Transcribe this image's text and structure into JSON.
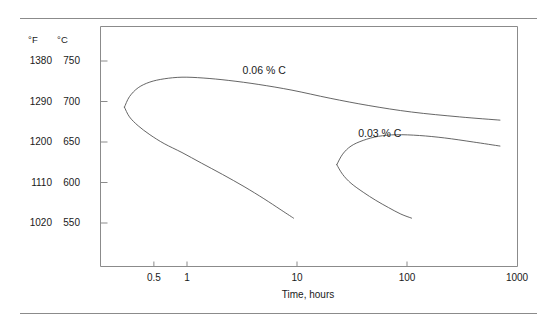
{
  "figure": {
    "background": "#ffffff",
    "line_color": "#555555",
    "frame_color": "#8b8b8b",
    "rule_color": "#8b8b8b"
  },
  "axis_headers": {
    "fahrenheit": "°F",
    "celsius": "°C"
  },
  "chart_data": {
    "type": "line",
    "title": "",
    "xlabel": "Time, hours",
    "ylabel": "",
    "xscale": "log",
    "xlim": [
      0.25,
      1000
    ],
    "ylim": [
      520,
      765
    ],
    "grid": false,
    "legend": "inline-annotations",
    "x_ticks": [
      {
        "value": 0.5,
        "label": "0.5"
      },
      {
        "value": 1,
        "label": "1"
      },
      {
        "value": 10,
        "label": "10"
      },
      {
        "value": 100,
        "label": "100"
      },
      {
        "value": 1000,
        "label": "1000"
      }
    ],
    "y_ticks": [
      {
        "celsius": 750,
        "fahrenheit": 1380,
        "label_c": "750",
        "label_f": "1380"
      },
      {
        "celsius": 700,
        "fahrenheit": 1290,
        "label_c": "700",
        "label_f": "1290"
      },
      {
        "celsius": 650,
        "fahrenheit": 1200,
        "label_c": "650",
        "label_f": "1200"
      },
      {
        "celsius": 600,
        "fahrenheit": 1110,
        "label_c": "600",
        "label_f": "1110"
      },
      {
        "celsius": 550,
        "fahrenheit": 1020,
        "label_c": "550",
        "label_f": "1020"
      }
    ],
    "series": [
      {
        "name": "0.06 % C",
        "label": "0.06 % C",
        "label_x_hours": 3.2,
        "label_y_celsius": 738,
        "upper_branch": [
          [
            0.27,
            693
          ],
          [
            0.3,
            706
          ],
          [
            0.36,
            717
          ],
          [
            0.46,
            724
          ],
          [
            0.62,
            728
          ],
          [
            0.9,
            730
          ],
          [
            1.4,
            729
          ],
          [
            2.4,
            726
          ],
          [
            4.5,
            721
          ],
          [
            9.0,
            714
          ],
          [
            20,
            704
          ],
          [
            45,
            695
          ],
          [
            110,
            687
          ],
          [
            300,
            681
          ],
          [
            700,
            677
          ]
        ],
        "lower_branch": [
          [
            0.27,
            693
          ],
          [
            0.3,
            681
          ],
          [
            0.36,
            670
          ],
          [
            0.46,
            659
          ],
          [
            0.62,
            648
          ],
          [
            0.9,
            637
          ],
          [
            1.35,
            624
          ],
          [
            2.1,
            610
          ],
          [
            3.3,
            595
          ],
          [
            5.0,
            580
          ],
          [
            7.0,
            567
          ],
          [
            9.3,
            556
          ]
        ]
      },
      {
        "name": "0.03 % C",
        "label": "0.03 % C",
        "label_x_hours": 36,
        "label_y_celsius": 660,
        "upper_branch": [
          [
            23,
            622
          ],
          [
            26,
            635
          ],
          [
            31,
            645
          ],
          [
            40,
            652
          ],
          [
            55,
            657
          ],
          [
            80,
            659
          ],
          [
            130,
            658
          ],
          [
            220,
            655
          ],
          [
            400,
            650
          ],
          [
            700,
            645
          ]
        ],
        "lower_branch": [
          [
            23,
            622
          ],
          [
            26,
            610
          ],
          [
            31,
            599
          ],
          [
            40,
            588
          ],
          [
            52,
            578
          ],
          [
            68,
            569
          ],
          [
            88,
            561
          ],
          [
            110,
            556
          ]
        ]
      }
    ]
  }
}
